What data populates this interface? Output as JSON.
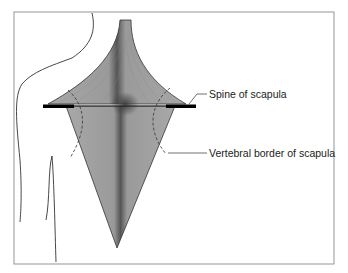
{
  "figure": {
    "type": "anatomical-diagram",
    "labels": [
      {
        "id": "spine",
        "text": "Spine of scapula"
      },
      {
        "id": "vertebral",
        "text": "Vertebral border of scapula"
      }
    ],
    "colors": {
      "muscle_fill": "#a9a9a9",
      "muscle_dark": "#555555",
      "outline": "#333333",
      "frame": "#8a8a8a",
      "bar": "#000000"
    }
  }
}
